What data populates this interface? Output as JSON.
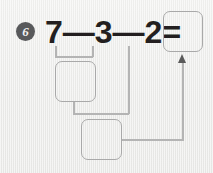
{
  "worksheet": {
    "problem_number": "6",
    "background_color": "#eeeeec",
    "ink_color": "#231f20",
    "box_border_color": "#a9a9a9",
    "connector_color": "#b4b4b4",
    "badge_color": "#58595b"
  },
  "equation": {
    "full_text": "7—3—2=",
    "operand_1": "7",
    "operator_1": "—",
    "operand_2": "3",
    "operator_2": "—",
    "operand_3": "2",
    "equals": "="
  },
  "boxes": {
    "answer": {
      "label": "",
      "placeholder": ""
    },
    "step_1": {
      "label": "",
      "placeholder": ""
    },
    "step_2": {
      "label": "",
      "placeholder": ""
    }
  },
  "connectors": {
    "bracket_label": "bracket-under-7-minus-3",
    "arrow_label": "arrow-to-answer-box"
  }
}
